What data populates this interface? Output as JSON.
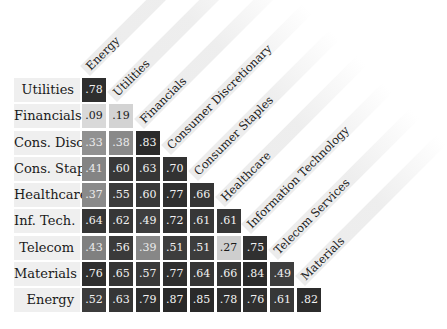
{
  "chart_data": {
    "type": "heatmap",
    "title": "",
    "subtitle": "",
    "layout": "lower-triangular correlation matrix",
    "row_labels": [
      "Utilities",
      "Financials",
      "Cons. Disc.",
      "Cons. Stap.",
      "Healthcare",
      "Inf. Tech.",
      "Telecom",
      "Materials",
      "Energy"
    ],
    "col_labels": [
      "Energy",
      "Utilities",
      "Financials",
      "Consumer Discretionary",
      "Consumer Staples",
      "Healthcare",
      "Information Technology",
      "Telecom Services",
      "Materials"
    ],
    "values": [
      [
        ".78"
      ],
      [
        ".09",
        ".19"
      ],
      [
        ".33",
        ".38",
        ".83"
      ],
      [
        ".41",
        ".60",
        ".63",
        ".70"
      ],
      [
        ".37",
        ".55",
        ".60",
        ".77",
        ".66"
      ],
      [
        ".64",
        ".62",
        ".49",
        ".72",
        ".61",
        ".61"
      ],
      [
        ".43",
        ".56",
        ".39",
        ".51",
        ".51",
        ".27",
        ".75"
      ],
      [
        ".76",
        ".65",
        ".57",
        ".77",
        ".64",
        ".66",
        ".84",
        ".49"
      ],
      [
        ".52",
        ".63",
        ".79",
        ".87",
        ".85",
        ".78",
        ".76",
        ".61",
        ".82"
      ]
    ],
    "numeric_values": [
      [
        0.78
      ],
      [
        0.09,
        0.19
      ],
      [
        0.33,
        0.38,
        0.83
      ],
      [
        0.41,
        0.6,
        0.63,
        0.7
      ],
      [
        0.37,
        0.55,
        0.6,
        0.77,
        0.66
      ],
      [
        0.64,
        0.62,
        0.49,
        0.72,
        0.61,
        0.61
      ],
      [
        0.43,
        0.56,
        0.39,
        0.51,
        0.51,
        0.27,
        0.75
      ],
      [
        0.76,
        0.65,
        0.57,
        0.77,
        0.64,
        0.66,
        0.84,
        0.49
      ],
      [
        0.52,
        0.63,
        0.79,
        0.87,
        0.85,
        0.78,
        0.76,
        0.61,
        0.82
      ]
    ],
    "color_scale": {
      "low": "#d9d9d9",
      "mid": "#8c8c8c",
      "high": "#2b2b2b",
      "threshold_note": "values >= .49 rendered dark; .33-.43 mid gray; <= .27 light gray"
    },
    "legend": "none",
    "grid": false
  }
}
